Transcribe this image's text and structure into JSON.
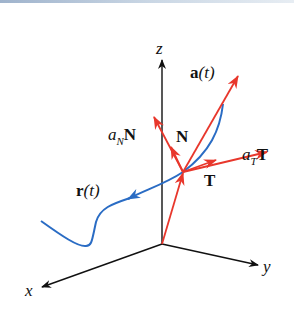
{
  "figure": {
    "colors": {
      "axes": "#111111",
      "vectors": "#e8372c",
      "curve": "#2a6cc4",
      "top_bar": "#b8c7d8"
    },
    "axes": {
      "x": "x",
      "y": "y",
      "z": "z"
    },
    "labels": {
      "acceleration": {
        "main": "a",
        "arg": "(t)"
      },
      "normal_component": {
        "coef": "a",
        "sub": "N",
        "vec": "N"
      },
      "tangential_component": {
        "coef": "a",
        "sub": "T",
        "vec": "T"
      },
      "unit_normal": "N",
      "unit_tangent": "T",
      "position": {
        "main": "r",
        "arg": "(t)"
      }
    }
  }
}
